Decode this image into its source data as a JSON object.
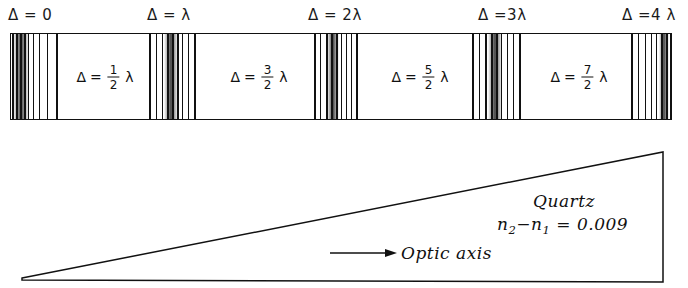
{
  "figure": {
    "ink_color": "#111111",
    "background_color": "#ffffff"
  },
  "top_axis": {
    "labels": [
      {
        "text": "Δ = 0",
        "x": 8
      },
      {
        "text": "Δ = λ",
        "x": 147
      },
      {
        "text": "Δ = 2λ",
        "x": 308
      },
      {
        "text": "Δ =3λ",
        "x": 478
      },
      {
        "text": "Δ =4 λ",
        "x": 622
      }
    ]
  },
  "bar": {
    "name": "interference-bar",
    "bands": [
      {
        "delta_symbol": "Δ",
        "equals": "=",
        "numerator": "1",
        "denominator": "2",
        "lambda": "λ",
        "center_x": 104
      },
      {
        "delta_symbol": "Δ",
        "equals": "=",
        "numerator": "3",
        "denominator": "2",
        "lambda": "λ",
        "center_x": 258
      },
      {
        "delta_symbol": "Δ",
        "equals": "=",
        "numerator": "5",
        "denominator": "2",
        "lambda": "λ",
        "center_x": 419
      },
      {
        "delta_symbol": "Δ",
        "equals": "=",
        "numerator": "7",
        "denominator": "2",
        "lambda": "λ",
        "center_x": 578
      }
    ],
    "fringe_groups": [
      {
        "order": "0",
        "start_x": 10,
        "end_x": 62,
        "line_offsets": [
          1,
          5,
          9,
          13,
          17,
          22,
          28,
          36,
          45
        ],
        "core_start": 2,
        "core_width": 16
      },
      {
        "order": "1",
        "start_x": 146,
        "end_x": 197,
        "line_offsets": [
          2,
          9,
          15,
          20,
          25,
          30,
          35,
          41,
          47
        ],
        "core_start": 17,
        "core_width": 14
      },
      {
        "order": "2",
        "start_x": 312,
        "end_x": 356,
        "line_offsets": [
          1,
          7,
          13,
          18,
          23,
          28,
          33,
          38,
          43
        ],
        "core_start": 14,
        "core_width": 12
      },
      {
        "order": "3",
        "start_x": 469,
        "end_x": 522,
        "line_offsets": [
          2,
          9,
          15,
          21,
          26,
          31,
          37,
          43,
          49
        ],
        "core_start": 18,
        "core_width": 14
      },
      {
        "order": "4",
        "start_x": 628,
        "end_x": 671,
        "line_offsets": [
          2,
          9,
          16,
          22,
          27,
          32,
          37,
          41,
          43
        ],
        "core_start": 30,
        "core_width": 10
      }
    ]
  },
  "wedge": {
    "name": "quartz-wedge",
    "apex": {
      "x": 22,
      "y": 278
    },
    "top_right": {
      "x": 663,
      "y": 152
    },
    "bottom_right": {
      "x": 663,
      "y": 282
    },
    "material": "Quartz",
    "birefringence": {
      "text": "n2−n1 = 0.009",
      "symbol_prefix": "n",
      "sub1": "2",
      "minus": "−",
      "sub2": "1",
      "equals": "=",
      "value": "0.009"
    },
    "optic_axis_label": "Optic axis",
    "arrow": {
      "start_x": 330,
      "end_x": 397,
      "y": 253
    }
  }
}
